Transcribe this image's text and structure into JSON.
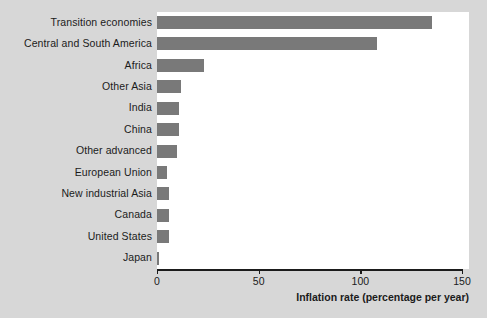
{
  "chart_data": {
    "type": "bar",
    "orientation": "horizontal",
    "title": "",
    "xlabel": "Inflation rate (percentage per year)",
    "ylabel": "",
    "xlim": [
      0,
      150
    ],
    "xticks": [
      0,
      50,
      100,
      150
    ],
    "xtick_labels": [
      "0",
      "50",
      "100",
      "150"
    ],
    "grid": false,
    "legend": null,
    "bar_color": "#797979",
    "plot_background": "#ffffff",
    "figure_background": "#d7d7d7",
    "categories": [
      "Transition economies",
      "Central and South America",
      "Africa",
      "Other Asia",
      "India",
      "China",
      "Other advanced",
      "European Union",
      "New industrial Asia",
      "Canada",
      "United States",
      "Japan"
    ],
    "values": [
      135,
      108,
      23,
      12,
      11,
      11,
      10,
      5,
      6,
      6,
      6,
      1
    ]
  }
}
